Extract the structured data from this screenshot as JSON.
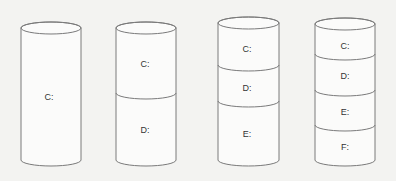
{
  "diagram": {
    "colors": {
      "background": "#f3f3f1",
      "stroke": "#7a7a7a",
      "label": "#333333"
    },
    "disks": [
      {
        "name": "disk-1-partition",
        "partitions": [
          {
            "label": "C:"
          }
        ]
      },
      {
        "name": "disk-2-partitions",
        "partitions": [
          {
            "label": "C:"
          },
          {
            "label": "D:"
          }
        ]
      },
      {
        "name": "disk-3-partitions",
        "partitions": [
          {
            "label": "C:"
          },
          {
            "label": "D:"
          },
          {
            "label": "E:"
          }
        ]
      },
      {
        "name": "disk-4-partitions",
        "partitions": [
          {
            "label": "C:"
          },
          {
            "label": "D:"
          },
          {
            "label": "E:"
          },
          {
            "label": "F:"
          }
        ]
      }
    ]
  }
}
